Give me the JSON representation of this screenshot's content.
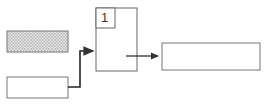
{
  "diagram": {
    "nodes": [
      {
        "id": "hatched-box",
        "style": "hatched",
        "label": ""
      },
      {
        "id": "input-box",
        "style": "plain",
        "label": ""
      },
      {
        "id": "main-box",
        "style": "plain",
        "label": ""
      },
      {
        "id": "main-box-badge",
        "style": "plain",
        "label": "1"
      },
      {
        "id": "output-box",
        "style": "plain",
        "label": ""
      }
    ],
    "edges": [
      {
        "from": "input-box",
        "to": "main-box"
      },
      {
        "from": "main-box",
        "to": "output-box"
      }
    ],
    "colors": {
      "stroke": "#555555",
      "hatch": "#888888",
      "background": "#ffffff"
    }
  }
}
